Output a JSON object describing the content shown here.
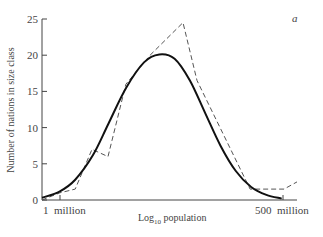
{
  "chart_data": {
    "type": "line",
    "title": "",
    "panel_label": "a",
    "xlabel": "Log10 population",
    "xlabel_parts": {
      "base": "Log",
      "sub": "10",
      "rest": " population"
    },
    "ylabel": "Number of nations in size class",
    "ylim": [
      0,
      25
    ],
    "yticks": [
      0,
      5,
      10,
      15,
      20,
      25
    ],
    "xtick_labels": [
      "1  million",
      "500  million"
    ],
    "grid": false,
    "legend": null,
    "series": [
      {
        "name": "observed (histogram polygon)",
        "style": "dashed",
        "x_rel": [
          0.0,
          0.07,
          0.13,
          0.196,
          0.259,
          0.329,
          0.424,
          0.553,
          0.608,
          0.816,
          0.949,
          1.0
        ],
        "values": [
          0,
          1,
          1.5,
          7,
          6,
          16,
          20,
          24.5,
          16.5,
          1.5,
          1.5,
          2.5
        ]
      },
      {
        "name": "fitted normal curve",
        "style": "solid",
        "x_rel": [
          0.0,
          0.07,
          0.13,
          0.2,
          0.26,
          0.33,
          0.4,
          0.46,
          0.52,
          0.58,
          0.64,
          0.7,
          0.76,
          0.82,
          0.88,
          0.94
        ],
        "values": [
          0.3,
          1.2,
          2.8,
          6.2,
          10.5,
          15.5,
          19.0,
          20.1,
          19.5,
          16.5,
          12.0,
          7.5,
          4.0,
          1.8,
          0.7,
          0.2
        ]
      }
    ]
  }
}
